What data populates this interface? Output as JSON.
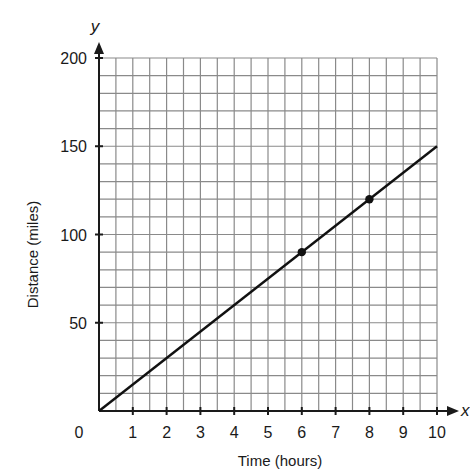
{
  "chart_data": {
    "type": "line",
    "title": "",
    "xlabel": "Time (hours)",
    "ylabel": "Distance (miles)",
    "x_axis_variable": "x",
    "y_axis_variable": "y",
    "xlim": [
      0,
      10
    ],
    "ylim": [
      0,
      200
    ],
    "x_grid_step": 0.5,
    "y_grid_step": 10,
    "grid": true,
    "x_ticks": [
      0,
      1,
      2,
      3,
      4,
      5,
      6,
      7,
      8,
      9,
      10
    ],
    "x_tick_labels": [
      "0",
      "1",
      "2",
      "3",
      "4",
      "5",
      "6",
      "7",
      "8",
      "9",
      "10"
    ],
    "y_ticks": [
      50,
      100,
      150,
      200
    ],
    "y_tick_labels": [
      "50",
      "100",
      "150",
      "200"
    ],
    "series": [
      {
        "name": "distance",
        "line": {
          "x": [
            0,
            10
          ],
          "y": [
            0,
            150
          ]
        },
        "points": [
          {
            "x": 6,
            "y": 90
          },
          {
            "x": 8,
            "y": 120
          }
        ]
      }
    ]
  }
}
